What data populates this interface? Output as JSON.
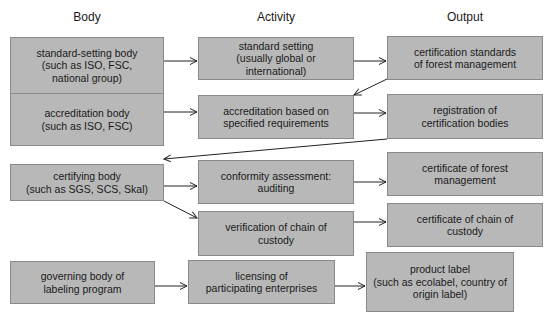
{
  "columns": {
    "body": "Body",
    "activity": "Activity",
    "output": "Output"
  },
  "boxes": {
    "standard_setting_body": "standard-setting body\n(such as ISO, FSC,\nnational group)",
    "accreditation_body": "accreditation body\n(such as ISO, FSC)",
    "certifying_body": "certifying body\n(such as SGS, SCS, Skal)",
    "governing_body": "governing body of\nlabeling program",
    "standard_setting": "standard setting\n(usually global or international)",
    "accreditation_based": "accreditation based on\nspecified requirements",
    "conformity_assessment": "conformity assessment:\nauditing",
    "verification_chain": "verification of chain of\ncustody",
    "licensing": "licensing of\nparticipating enterprises",
    "certification_standards": "certification standards\nof forest management",
    "registration": "registration of\ncertification bodies",
    "certificate_forest": "certificate of forest\nmanagement",
    "certificate_chain": "certificate of chain of\ncustody",
    "product_label": "product label\n(such as ecolabel, country of\norigin label)"
  },
  "colors": {
    "box_fill": "#b8b8b8",
    "box_border": "#8a8a8a",
    "arrow": "#222222"
  }
}
